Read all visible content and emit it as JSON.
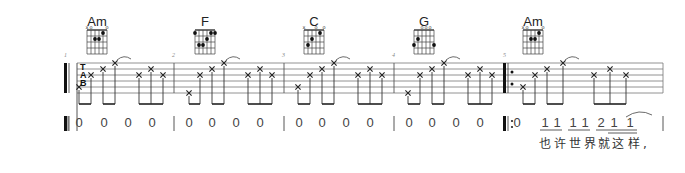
{
  "score": {
    "tab_label": [
      "T",
      "A",
      "B"
    ],
    "staff": {
      "x_start": 77,
      "x_end": 663,
      "y_top": 63,
      "line_gap": 6,
      "lines": 6
    },
    "measures": [
      {
        "number": "1",
        "chord": "Am",
        "x_start": 68,
        "x_end": 174,
        "notes": [
          {
            "x": 79,
            "string": 5
          },
          {
            "x": 91,
            "string": 3
          },
          {
            "x": 103,
            "string": 2
          },
          {
            "x": 115,
            "string": 1,
            "tie": true
          },
          {
            "x": 139,
            "string": 3
          },
          {
            "x": 151,
            "string": 2
          },
          {
            "x": 163,
            "string": 3
          }
        ],
        "numbered": [
          "0",
          "0",
          "0",
          "0"
        ]
      },
      {
        "number": "2",
        "chord": "F",
        "x_start": 174,
        "x_end": 284,
        "notes": [
          {
            "x": 189,
            "string": 6
          },
          {
            "x": 200,
            "string": 3
          },
          {
            "x": 212,
            "string": 2
          },
          {
            "x": 224,
            "string": 1,
            "tie": true
          },
          {
            "x": 248,
            "string": 3
          },
          {
            "x": 260,
            "string": 2
          },
          {
            "x": 272,
            "string": 3
          }
        ],
        "numbered": [
          "0",
          "0",
          "0",
          "0"
        ]
      },
      {
        "number": "3",
        "chord": "C",
        "x_start": 284,
        "x_end": 394,
        "notes": [
          {
            "x": 298,
            "string": 5
          },
          {
            "x": 310,
            "string": 3
          },
          {
            "x": 322,
            "string": 2
          },
          {
            "x": 334,
            "string": 1,
            "tie": true
          },
          {
            "x": 358,
            "string": 3
          },
          {
            "x": 370,
            "string": 2
          },
          {
            "x": 382,
            "string": 3
          }
        ],
        "numbered": [
          "0",
          "0",
          "0",
          "0"
        ]
      },
      {
        "number": "4",
        "chord": "G",
        "x_start": 394,
        "x_end": 505,
        "notes": [
          {
            "x": 408,
            "string": 6
          },
          {
            "x": 420,
            "string": 3
          },
          {
            "x": 432,
            "string": 2
          },
          {
            "x": 444,
            "string": 1,
            "tie": true
          },
          {
            "x": 468,
            "string": 3
          },
          {
            "x": 480,
            "string": 2
          },
          {
            "x": 492,
            "string": 3
          }
        ],
        "numbered": [
          "0",
          "0",
          "0",
          "0"
        ]
      },
      {
        "number": "5",
        "chord": "Am",
        "x_start": 505,
        "x_end": 663,
        "repeat_start": true,
        "notes": [
          {
            "x": 523,
            "string": 5
          },
          {
            "x": 535,
            "string": 3
          },
          {
            "x": 547,
            "string": 2
          },
          {
            "x": 563,
            "string": 1,
            "tie": true
          },
          {
            "x": 594,
            "string": 3
          },
          {
            "x": 610,
            "string": 2
          },
          {
            "x": 626,
            "string": 3
          }
        ],
        "numbered": [
          "0",
          "1",
          "1",
          "1",
          "1",
          "2",
          "1",
          "1"
        ],
        "lyrics": "也许世界就这 样,"
      }
    ],
    "chords": {
      "Am": {
        "name": "Am",
        "marks": [
          "x",
          "o",
          "",
          "",
          "",
          "o"
        ],
        "dots": [
          [
            2,
            2
          ],
          [
            3,
            2
          ],
          [
            4,
            1
          ]
        ]
      },
      "F": {
        "name": "F",
        "marks": [
          "",
          "",
          "",
          "",
          "",
          ""
        ],
        "dots": [
          [
            0,
            1
          ],
          [
            5,
            1
          ],
          [
            4,
            1
          ],
          [
            3,
            2
          ],
          [
            1,
            3
          ],
          [
            2,
            3
          ]
        ]
      },
      "C": {
        "name": "C",
        "marks": [
          "x",
          "",
          "",
          "o",
          "",
          "o"
        ],
        "dots": [
          [
            1,
            3
          ],
          [
            2,
            2
          ],
          [
            4,
            1
          ]
        ]
      },
      "G": {
        "name": "G",
        "marks": [
          "",
          "",
          "o",
          "o",
          "o",
          ""
        ],
        "dots": [
          [
            1,
            2
          ],
          [
            0,
            3
          ],
          [
            5,
            3
          ]
        ]
      }
    }
  }
}
